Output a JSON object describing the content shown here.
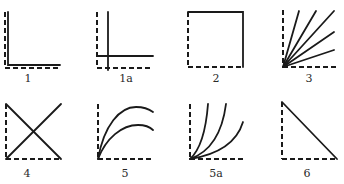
{
  "figure": {
    "panels": [
      {
        "id": "1",
        "label": "1",
        "shape": "solid L-shape hugging dashed axes"
      },
      {
        "id": "1a",
        "label": "1a",
        "shape": "solid cross offset inside dashed axes"
      },
      {
        "id": "2",
        "label": "2",
        "shape": "square: dashed left and bottom, solid top and right"
      },
      {
        "id": "3",
        "label": "3",
        "shape": "five straight solid rays fanning out from the origin"
      },
      {
        "id": "4",
        "label": "4",
        "shape": "two solid diagonals forming an X"
      },
      {
        "id": "5",
        "label": "5",
        "shape": "two concave-down solid curves rising from origin"
      },
      {
        "id": "5a",
        "label": "5a",
        "shape": "three concave-up solid curves rising from origin"
      },
      {
        "id": "6",
        "label": "6",
        "shape": "right triangle: dashed legs, solid hypotenuse"
      }
    ]
  },
  "colors": {
    "line": "#1a1a1a",
    "label": "#2a2a2a",
    "background": "#ffffff"
  }
}
